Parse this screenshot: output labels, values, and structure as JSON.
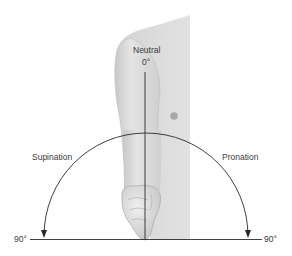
{
  "figure": {
    "labels": {
      "neutral": "Neutral",
      "neutral_angle": "0°",
      "left_motion": "Supination",
      "right_motion": "Pronation",
      "left_angle": "90°",
      "right_angle": "90°"
    },
    "colors": {
      "skin_light": "#e6e6e6",
      "skin_mid": "#d2d2d2",
      "skin_dark": "#b4b4b4",
      "line": "#2a2a2a",
      "text": "#3a3a3a"
    }
  }
}
